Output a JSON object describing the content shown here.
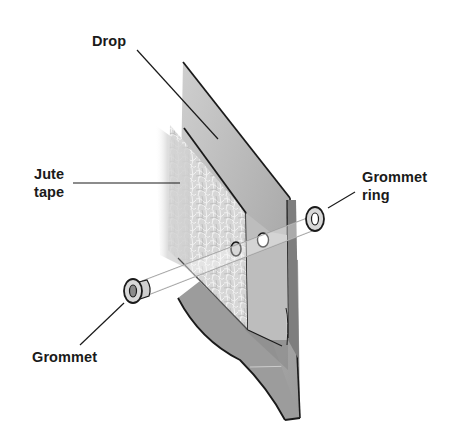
{
  "diagram": {
    "labels": {
      "drop": "Drop",
      "jute_tape_line1": "Jute",
      "jute_tape_line2": "tape",
      "grommet_ring_line1": "Grommet",
      "grommet_ring_line2": "ring",
      "grommet": "Grommet"
    },
    "colors": {
      "background": "#ffffff",
      "outline": "#1a1a1a",
      "fabric_light": "#c9c9c9",
      "fabric_mid": "#a8a8a8",
      "fabric_dark": "#8c8c8c",
      "jute": "#d8d8d8",
      "label_text": "#1a1a1a"
    }
  }
}
